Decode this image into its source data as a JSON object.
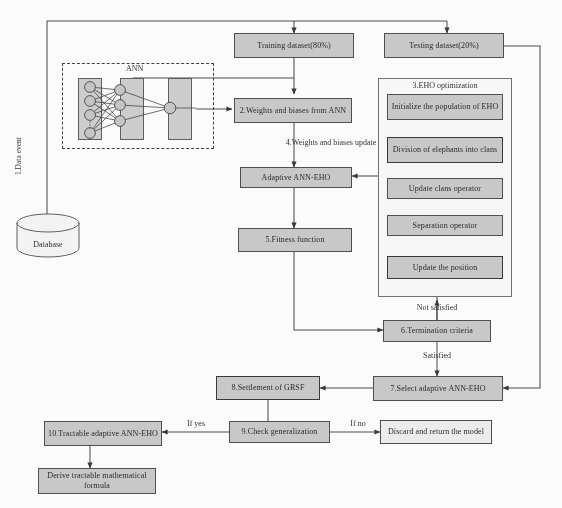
{
  "diagram": {
    "colors": {
      "node_fill": "#c9c9c9",
      "node_fill_light": "#efefef",
      "panel_fill": "#fbfbfb",
      "stroke": "#4a4a4a",
      "text": "#232323",
      "background": "#ffffff"
    }
  },
  "source": {
    "data_event_label": "1.Data event",
    "database_label": "Database"
  },
  "ann_block": {
    "title": "ANN",
    "input_nodes": 4,
    "hidden_nodes": 3,
    "output_nodes": 1
  },
  "nodes": {
    "training_dataset": "Training dataset(80%)",
    "testing_dataset": "Testing dataset(20%)",
    "weights_biases_from_ann": "2.Weights and biases from ANN",
    "adaptive_ann_eho": "Adaptive ANN-EHO",
    "fitness_function": "5.Fitness function",
    "termination_criteria": "6.Termination criteria",
    "select_adaptive_ann_eho": "7.Select adaptive ANN-EHO",
    "settlement_of_grsf": "8.Settlement of GRSF",
    "check_generalization": "9.Check generalization",
    "tractable_adaptive_ann_eho": "10.Tractable adaptive ANN-EHO",
    "discard_return_model": "Discard and return the model",
    "derive_formula": "Derive tractable mathematical formula"
  },
  "eho_panel": {
    "title": "3.EHO optimization",
    "steps": [
      "Initialize the population of EHO",
      "Division of elephants into clans",
      "Update clans operator",
      "Separation operator",
      "Update the position"
    ]
  },
  "edge_labels": {
    "weights_biases_update": "4.Weights and biases update",
    "not_satisfied": "Not satisfied",
    "satisfied": "Satisfied",
    "if_yes": "If yes",
    "if_no": "If no"
  }
}
